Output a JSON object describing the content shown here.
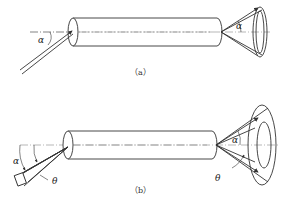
{
  "figure": {
    "panel_a": {
      "caption": "（a）",
      "alpha_left": "α",
      "alpha_right": "α"
    },
    "panel_b": {
      "caption": "（b）",
      "alpha_left": "α",
      "theta_left": "θ",
      "alpha_right": "α",
      "theta_right": "θ"
    }
  },
  "colors": {
    "stroke": "#333333",
    "axis": "#888888",
    "background": "#ffffff"
  }
}
